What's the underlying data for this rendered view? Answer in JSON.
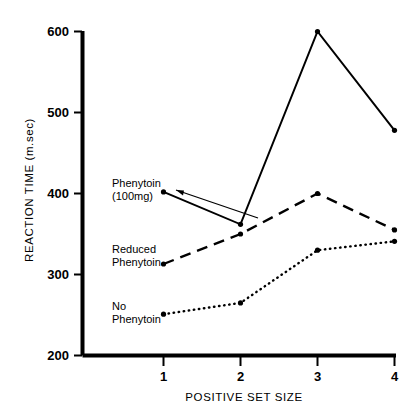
{
  "chart_data": {
    "type": "line",
    "title": "",
    "xlabel": "POSITIVE SET SIZE",
    "ylabel": "REACTION TIME (m.sec)",
    "x": [
      1,
      2,
      3,
      4
    ],
    "categories": [
      "1",
      "2",
      "3",
      "4"
    ],
    "xlim": [
      0.6,
      4.3
    ],
    "ylim": [
      200,
      600
    ],
    "yticks": [
      200,
      300,
      400,
      500,
      600
    ],
    "ytick_labels": [
      "200",
      "300",
      "400",
      "500",
      "600"
    ],
    "xticks": [
      1,
      2,
      3,
      4
    ],
    "xtick_labels": [
      "1",
      "2",
      "3",
      "4"
    ],
    "grid": false,
    "legend": "inline-annotations",
    "series": [
      {
        "name": "Phenytoin (100mg)",
        "label_lines": [
          "Phenytoin",
          "(100mg)"
        ],
        "linestyle": "solid",
        "marker": "dot",
        "color": "#000000",
        "values": [
          402,
          362,
          600,
          478
        ]
      },
      {
        "name": "Reduced Phenytoin",
        "label_lines": [
          "Reduced",
          "Phenytoin"
        ],
        "linestyle": "dashed",
        "marker": "dot",
        "color": "#000000",
        "values": [
          313,
          350,
          400,
          355
        ]
      },
      {
        "name": "No Phenytoin",
        "label_lines": [
          "No",
          "Phenytoin"
        ],
        "linestyle": "dotted",
        "marker": "dot",
        "color": "#000000",
        "values": [
          251,
          265,
          330,
          341
        ]
      }
    ]
  },
  "axes": {
    "y_title": "REACTION TIME (m.sec)",
    "x_title": "POSITIVE SET SIZE",
    "y_ticks": [
      "600",
      "500",
      "400",
      "300",
      "200"
    ],
    "x_ticks": [
      "1",
      "2",
      "3",
      "4"
    ]
  },
  "annotations": {
    "phenytoin_line1": "Phenytoin",
    "phenytoin_line2": "(100mg)",
    "reduced_line1": "Reduced",
    "reduced_line2": "Phenytoin",
    "none_line1": "No",
    "none_line2": "Phenytoin"
  },
  "colors": {
    "ink": "#000000",
    "background": "#ffffff"
  }
}
